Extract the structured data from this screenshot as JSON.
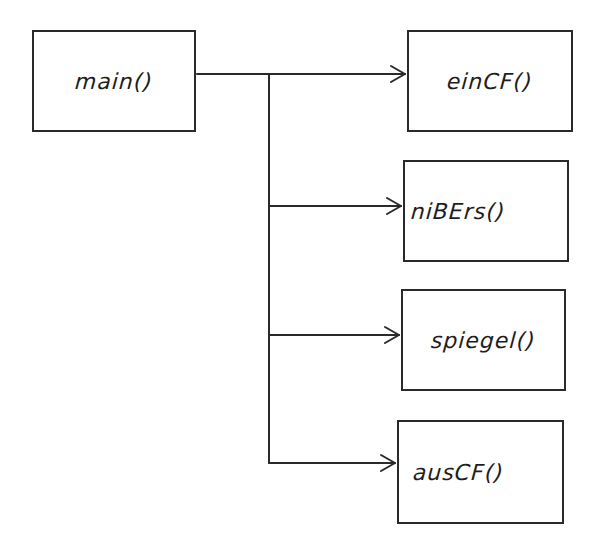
{
  "diagram": {
    "type": "call-hierarchy",
    "line_color": "#2a2a2a",
    "background": "#ffffff",
    "root": {
      "id": "main",
      "label": "main()"
    },
    "children": [
      {
        "id": "ein",
        "label": "einCF()"
      },
      {
        "id": "nib",
        "label": "niBErs()"
      },
      {
        "id": "spi",
        "label": "spiegel()"
      },
      {
        "id": "aus",
        "label": "ausCF()"
      }
    ],
    "edges": [
      {
        "from": "main",
        "to": "ein"
      },
      {
        "from": "main",
        "to": "nib"
      },
      {
        "from": "main",
        "to": "spi"
      },
      {
        "from": "main",
        "to": "aus"
      }
    ]
  }
}
